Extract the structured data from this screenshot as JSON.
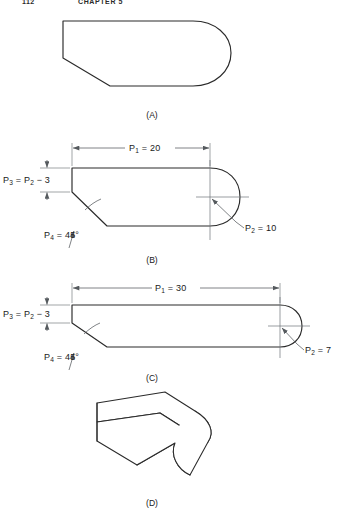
{
  "page": {
    "running_head_folio": "112",
    "running_head_chapter": "CHAPTER 5"
  },
  "figures": [
    {
      "id": "A",
      "caption": "(A)",
      "description": "Generic rounded-end profile, undimensioned"
    },
    {
      "id": "B",
      "caption": "(B)",
      "dimensions": {
        "length_label": "P",
        "length_sub": "1",
        "length_eq": " = 20",
        "radius_label": "P",
        "radius_sub": "2",
        "radius_eq": " = 10",
        "height_label": "P",
        "height_sub": "3",
        "height_eq": " = P",
        "height_sub2": "2",
        "height_eq2": " − 3",
        "angle_label": "P",
        "angle_sub": "4",
        "angle_eq": " = 45°"
      }
    },
    {
      "id": "C",
      "caption": "(C)",
      "dimensions": {
        "length_label": "P",
        "length_sub": "1",
        "length_eq": " = 30",
        "radius_label": "P",
        "radius_sub": "2",
        "radius_eq": " = 7",
        "height_label": "P",
        "height_sub": "3",
        "height_eq": " = P",
        "height_sub2": "2",
        "height_eq2": " − 3",
        "angle_label": "P",
        "angle_sub": "4",
        "angle_eq": " = 45°"
      }
    },
    {
      "id": "D",
      "caption": "(D)",
      "description": "Isometric pictorial of extruded profile"
    }
  ],
  "colors": {
    "outline": "#2a2a2a",
    "dimension": "#555a5e",
    "extension": "#7a7f83",
    "background": "#ffffff"
  }
}
